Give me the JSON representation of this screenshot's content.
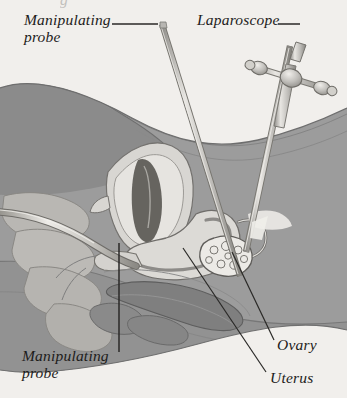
{
  "figure": {
    "background_color": "#f1efec",
    "ink_color": "#1d1c1b",
    "clipped_text_fragment": "g"
  },
  "labels": {
    "manipulating_probe_top": "Manipulating\nprobe",
    "laparoscope": "Laparoscope",
    "manipulating_probe_bottom": "Manipulating\nprobe",
    "ovary": "Ovary",
    "uterus": "Uterus"
  },
  "anatomy": {
    "parts": [
      {
        "name": "abdominal-body",
        "label": "Abdomen",
        "color": "#9c9c9c"
      },
      {
        "name": "upper-torso-mass",
        "label": "Upper torso",
        "color": "#8b8b8b"
      },
      {
        "name": "bladder",
        "label": "Bladder",
        "color": "#d8d6d2"
      },
      {
        "name": "bladder-lumen",
        "label": "Bladder lumen",
        "color": "#6c6a68"
      },
      {
        "name": "uterus",
        "label": "Uterus",
        "color": "#dcdad6"
      },
      {
        "name": "uterine-cavity",
        "label": "Uterine cavity",
        "color": "#8d8b88"
      },
      {
        "name": "ovary",
        "label": "Ovary",
        "color": "#eceae6"
      },
      {
        "name": "fallopian-tube",
        "label": "Fallopian tube",
        "color": "#d2d0cc"
      },
      {
        "name": "rectum",
        "label": "Rectum",
        "color": "#7f7f7f"
      },
      {
        "name": "sacrum-vertebrae",
        "label": "Sacrum",
        "color": "#c9c7c3"
      }
    ]
  },
  "instruments": {
    "laparoscope": {
      "name": "laparoscope",
      "label": "Laparoscope",
      "shaft_color": "#c6c4c0",
      "valve_ports": 2
    },
    "manipulating_probe": {
      "name": "manipulating-probe",
      "label": "Manipulating probe",
      "shaft_color": "#cfcdc9"
    }
  },
  "leader_lines": {
    "count": 5,
    "color": "#2a2927"
  }
}
